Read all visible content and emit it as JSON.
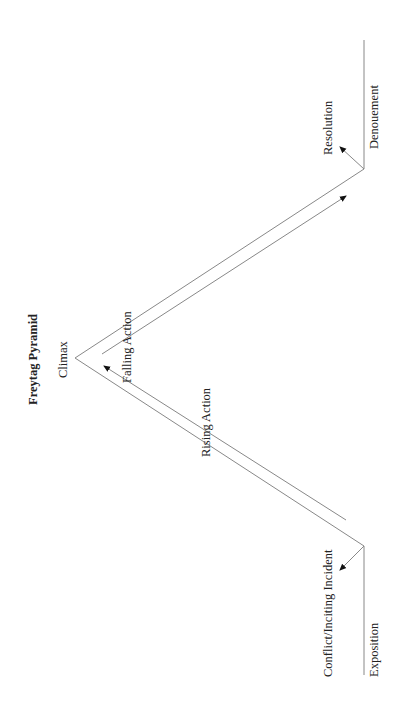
{
  "title": "Freytag Pyramid",
  "labels": {
    "climax": "Climax",
    "rising_action": "Rising Action",
    "falling_action": "Falling Action",
    "conflict": "Conflict/Inciting Incident",
    "exposition": "Exposition",
    "resolution": "Resolution",
    "denouement": "Denouement"
  },
  "colors": {
    "line": "#888888",
    "text": "#222222"
  }
}
